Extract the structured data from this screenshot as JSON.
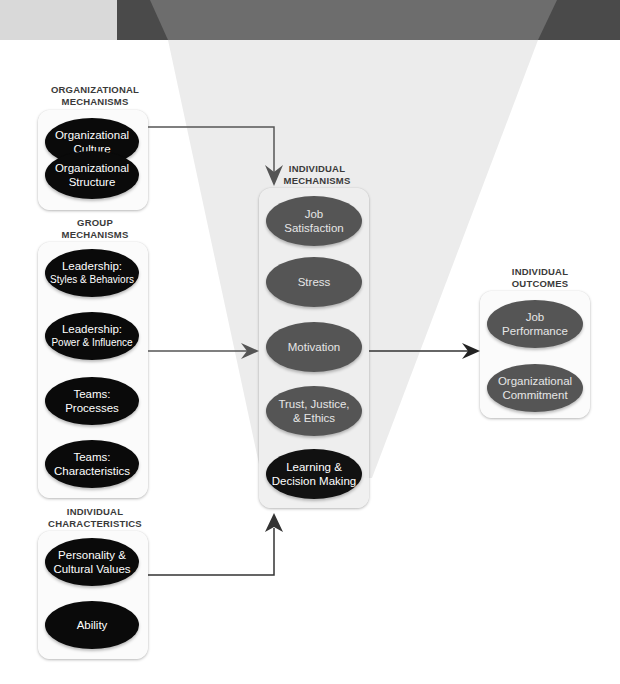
{
  "diagram": {
    "colors": {
      "top_band_light": "#d9d9d9",
      "top_band_dark": "#4a4a4a",
      "funnel_light": "#ececec",
      "funnel_dark_on_band": "#6d6d6d",
      "oval_black": "#0a0a0a",
      "oval_grey": "#555555",
      "connector": "#555555"
    },
    "organizational_mechanisms": {
      "label_line1": "ORGANIZATIONAL",
      "label_line2": "MECHANISMS",
      "items": [
        {
          "line1": "Organizational",
          "line2": "Culture"
        },
        {
          "line1": "Organizational",
          "line2": "Structure"
        }
      ]
    },
    "group_mechanisms": {
      "label_line1": "GROUP",
      "label_line2": "MECHANISMS",
      "items": [
        {
          "line1": "Leadership:",
          "line2": "Styles & Behaviors"
        },
        {
          "line1": "Leadership:",
          "line2": "Power & Influence"
        },
        {
          "line1": "Teams:",
          "line2": "Processes"
        },
        {
          "line1": "Teams:",
          "line2": "Characteristics"
        }
      ]
    },
    "individual_characteristics": {
      "label_line1": "INDIVIDUAL",
      "label_line2": "CHARACTERISTICS",
      "items": [
        {
          "line1": "Personality  &",
          "line2": "Cultural Values"
        },
        {
          "line1": "Ability",
          "line2": ""
        }
      ]
    },
    "individual_mechanisms": {
      "label_line1": "INDIVIDUAL",
      "label_line2": "MECHANISMS",
      "items": [
        {
          "line1": "Job",
          "line2": "Satisfaction"
        },
        {
          "line1": "Stress",
          "line2": ""
        },
        {
          "line1": "Motivation",
          "line2": ""
        },
        {
          "line1": "Trust, Justice,",
          "line2": "& Ethics"
        },
        {
          "line1": "Learning &",
          "line2": "Decision Making"
        }
      ]
    },
    "individual_outcomes": {
      "label_line1": "INDIVIDUAL",
      "label_line2": "OUTCOMES",
      "items": [
        {
          "line1": "Job",
          "line2": "Performance"
        },
        {
          "line1": "Organizational",
          "line2": "Commitment"
        }
      ]
    }
  }
}
